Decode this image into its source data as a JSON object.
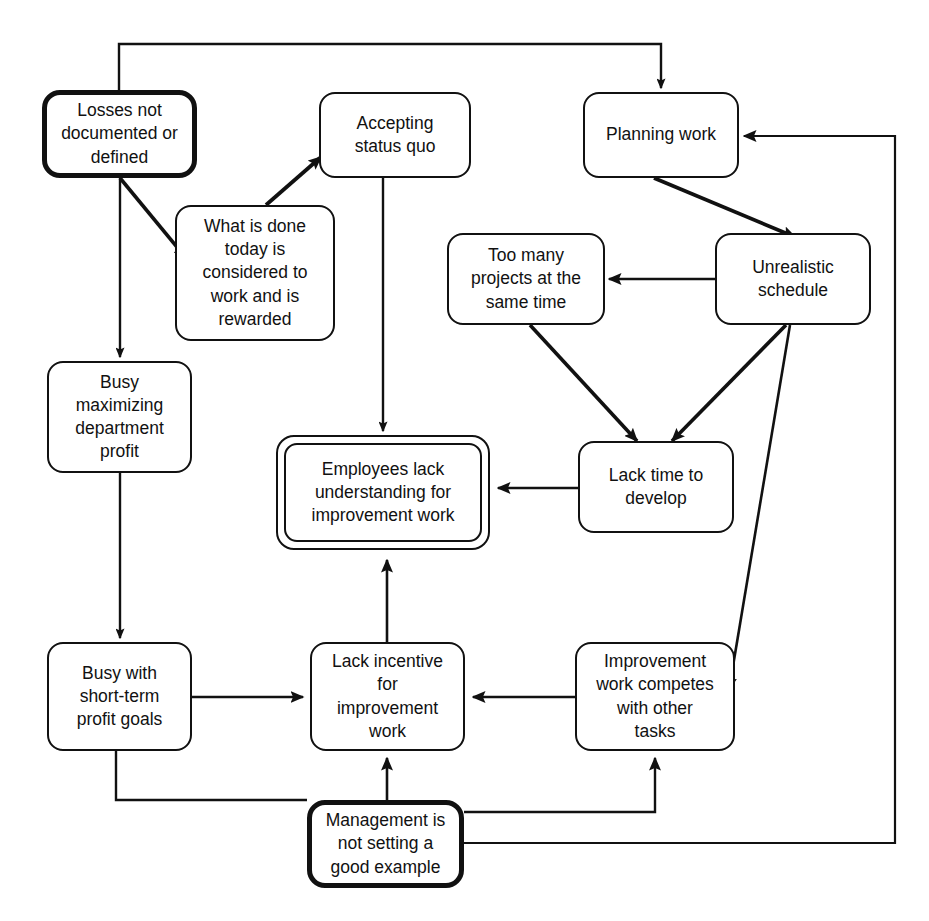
{
  "diagram": {
    "type": "cause-and-effect flowchart",
    "canvas": {
      "width": 929,
      "height": 921
    },
    "style": {
      "background": "#ffffff",
      "line_color": "#111111",
      "text_color": "#111111",
      "node_fill": "#ffffff"
    },
    "nodes": [
      {
        "id": "losses",
        "label": "Losses not\ndocumented or\ndefined",
        "emphasis": "thick",
        "x": 42,
        "y": 90,
        "w": 155,
        "h": 88
      },
      {
        "id": "what_is_done",
        "label": "What is done\ntoday is\nconsidered to\nwork and is\nrewarded",
        "emphasis": "normal",
        "x": 175,
        "y": 205,
        "w": 160,
        "h": 136
      },
      {
        "id": "accepting",
        "label": "Accepting\nstatus quo",
        "emphasis": "normal",
        "x": 319,
        "y": 92,
        "w": 152,
        "h": 86
      },
      {
        "id": "planning",
        "label": "Planning work",
        "emphasis": "normal",
        "x": 583,
        "y": 92,
        "w": 156,
        "h": 86
      },
      {
        "id": "too_many",
        "label": "Too many\nprojects at the\nsame time",
        "emphasis": "normal",
        "x": 447,
        "y": 233,
        "w": 158,
        "h": 92
      },
      {
        "id": "unrealistic",
        "label": "Unrealistic\nschedule",
        "emphasis": "normal",
        "x": 715,
        "y": 233,
        "w": 156,
        "h": 92
      },
      {
        "id": "busy_max",
        "label": "Busy\nmaximizing\ndepartment\nprofit",
        "emphasis": "normal",
        "x": 47,
        "y": 361,
        "w": 145,
        "h": 112
      },
      {
        "id": "employees_lack",
        "label": "Employees lack\nunderstanding for\nimprovement work",
        "emphasis": "double",
        "x": 276,
        "y": 435,
        "w": 214,
        "h": 115
      },
      {
        "id": "lack_time",
        "label": "Lack time to\ndevelop",
        "emphasis": "normal",
        "x": 578,
        "y": 441,
        "w": 156,
        "h": 92
      },
      {
        "id": "busy_short",
        "label": "Busy with\nshort-term\nprofit goals",
        "emphasis": "normal",
        "x": 47,
        "y": 642,
        "w": 145,
        "h": 109
      },
      {
        "id": "lack_incentive",
        "label": "Lack incentive\nfor\nimprovement\nwork",
        "emphasis": "normal",
        "x": 310,
        "y": 642,
        "w": 155,
        "h": 109
      },
      {
        "id": "improvement_competes",
        "label": "Improvement\nwork competes\nwith other\ntasks",
        "emphasis": "normal",
        "x": 575,
        "y": 642,
        "w": 160,
        "h": 109
      },
      {
        "id": "management",
        "label": "Management is\nnot setting a\ngood example",
        "emphasis": "thick",
        "x": 307,
        "y": 800,
        "w": 157,
        "h": 88
      }
    ],
    "edges": [
      {
        "from": "losses",
        "to": "planning",
        "arrow": true,
        "style": "orthogonal-top-loop"
      },
      {
        "from": "losses",
        "to": "what_is_done",
        "arrow": true,
        "style": "diagonal"
      },
      {
        "from": "losses",
        "to": "busy_max",
        "arrow": true,
        "style": "vertical"
      },
      {
        "from": "what_is_done",
        "to": "accepting",
        "arrow": true,
        "style": "diagonal"
      },
      {
        "from": "accepting",
        "to": "employees_lack",
        "arrow": true,
        "style": "vertical"
      },
      {
        "from": "planning",
        "to": "unrealistic",
        "arrow": true,
        "style": "diagonal"
      },
      {
        "from": "unrealistic",
        "to": "too_many",
        "arrow": true,
        "style": "horizontal"
      },
      {
        "from": "unrealistic",
        "to": "lack_time",
        "arrow": true,
        "style": "diagonal"
      },
      {
        "from": "unrealistic",
        "to": "improvement_competes",
        "arrow": true,
        "style": "diagonal"
      },
      {
        "from": "too_many",
        "to": "lack_time",
        "arrow": true,
        "style": "diagonal"
      },
      {
        "from": "lack_time",
        "to": "employees_lack",
        "arrow": true,
        "style": "horizontal"
      },
      {
        "from": "busy_max",
        "to": "busy_short",
        "arrow": true,
        "style": "vertical"
      },
      {
        "from": "busy_short",
        "to": "lack_incentive",
        "arrow": true,
        "style": "horizontal"
      },
      {
        "from": "improvement_competes",
        "to": "lack_incentive",
        "arrow": true,
        "style": "horizontal"
      },
      {
        "from": "lack_incentive",
        "to": "employees_lack",
        "arrow": true,
        "style": "vertical"
      },
      {
        "from": "management",
        "to": "lack_incentive",
        "arrow": true,
        "style": "vertical"
      },
      {
        "from": "management",
        "to": "improvement_competes",
        "arrow": true,
        "style": "orthogonal"
      },
      {
        "from": "management",
        "to": "planning",
        "arrow": true,
        "style": "orthogonal-right-loop"
      },
      {
        "from": "busy_short",
        "to": "management",
        "arrow": false,
        "style": "orthogonal"
      }
    ]
  }
}
